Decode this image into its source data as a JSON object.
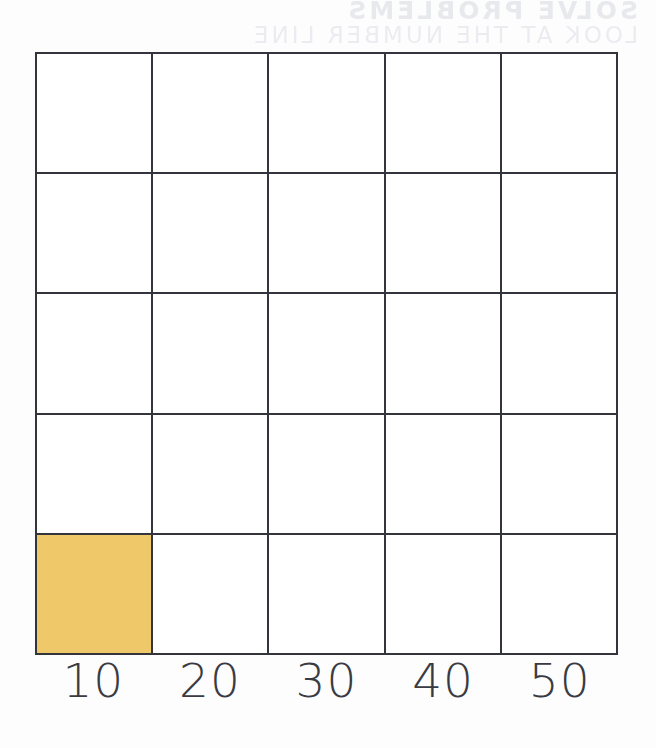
{
  "page": {
    "background_color": "#fdfdfe",
    "bleed_through": {
      "visible": true,
      "description": "faint mirrored show-through text from the reverse side of the scanned page",
      "line_1": "SOLVE PROBLEMS",
      "line_2": "LOOK AT THE NUMBER LINE"
    }
  },
  "grid": {
    "columns": 5,
    "rows": 5,
    "line_color": "#33343c",
    "cell_color": "#ffffff",
    "highlight_color": "#efc969",
    "filled_cells": [
      {
        "row": 5,
        "column": 1
      }
    ],
    "cells": [
      [
        {
          "filled": false
        },
        {
          "filled": false
        },
        {
          "filled": false
        },
        {
          "filled": false
        },
        {
          "filled": false
        }
      ],
      [
        {
          "filled": false
        },
        {
          "filled": false
        },
        {
          "filled": false
        },
        {
          "filled": false
        },
        {
          "filled": false
        }
      ],
      [
        {
          "filled": false
        },
        {
          "filled": false
        },
        {
          "filled": false
        },
        {
          "filled": false
        },
        {
          "filled": false
        }
      ],
      [
        {
          "filled": false
        },
        {
          "filled": false
        },
        {
          "filled": false
        },
        {
          "filled": false
        },
        {
          "filled": false
        }
      ],
      [
        {
          "filled": true
        },
        {
          "filled": false
        },
        {
          "filled": false
        },
        {
          "filled": false
        },
        {
          "filled": false
        }
      ]
    ]
  },
  "axis": {
    "labels": [
      "10",
      "20",
      "30",
      "40",
      "50"
    ],
    "text_color": "#3a3b42"
  },
  "chart_data": {
    "type": "bar",
    "title": "",
    "xlabel": "",
    "ylabel": "",
    "categories": [
      "10",
      "20",
      "30",
      "40",
      "50"
    ],
    "values": [
      1,
      0,
      0,
      0,
      0
    ],
    "ylim": [
      0,
      5
    ],
    "grid": true,
    "legend": "none"
  }
}
